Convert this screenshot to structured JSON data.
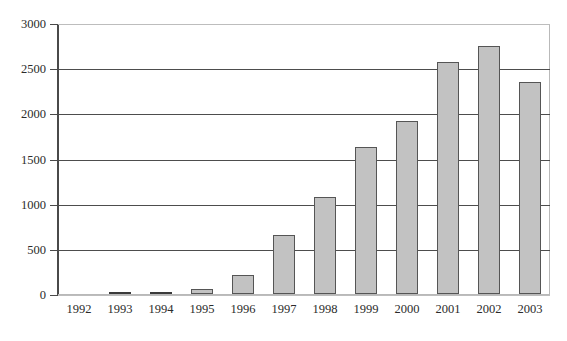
{
  "chart_data": {
    "type": "bar",
    "title": "",
    "subtitle": "",
    "xlabel": "",
    "ylabel": "",
    "categories": [
      "1992",
      "1993",
      "1994",
      "1995",
      "1996",
      "1997",
      "1998",
      "1999",
      "2000",
      "2001",
      "2002",
      "2003"
    ],
    "values": [
      0,
      8,
      10,
      50,
      210,
      650,
      1075,
      1625,
      1915,
      2570,
      2740,
      2350
    ],
    "series": [
      {
        "name": "",
        "values": [
          0,
          8,
          10,
          50,
          210,
          650,
          1075,
          1625,
          1915,
          2570,
          2740,
          2350
        ]
      }
    ],
    "ylim": [
      0,
      3000
    ],
    "ytick_values": [
      0,
      500,
      1000,
      1500,
      2000,
      2500,
      3000
    ],
    "ytick_labels": [
      "0",
      "500",
      "1000",
      "1500",
      "2000",
      "2500",
      "3000"
    ],
    "grid": true,
    "legend": false,
    "legend_position": "none",
    "annotations": [],
    "colors": {
      "bar_fill": "#c2c2c2",
      "bar_border": "#555555",
      "gridline": "#4d4d4d",
      "axis": "#4a4a4a",
      "frame": "#b9b9b9",
      "text": "#2b2b2b",
      "background": "#ffffff"
    }
  }
}
